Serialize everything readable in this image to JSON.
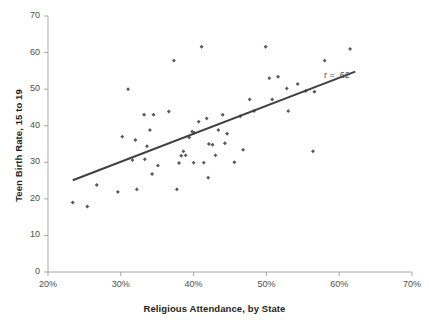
{
  "chart_data": {
    "type": "scatter",
    "title": "",
    "xlabel": "Religious Attendance, by State",
    "ylabel": "Teen Birth Rate, 15 to 19",
    "xlim": [
      20,
      70
    ],
    "ylim": [
      0,
      70
    ],
    "xticks": [
      20,
      30,
      40,
      50,
      60,
      70
    ],
    "yticks": [
      0,
      10,
      20,
      30,
      40,
      50,
      60,
      70
    ],
    "xtick_labels": [
      "20%",
      "30%",
      "40%",
      "50%",
      "60%",
      "70%"
    ],
    "ytick_labels": [
      "0",
      "10",
      "20",
      "30",
      "40",
      "50",
      "60",
      "70"
    ],
    "xtick_suffix": "%",
    "grid": false,
    "legend": "none",
    "marker_color": "#595959",
    "line_color": "#404040",
    "axis_color": "#a6a6a6",
    "annotations": [
      {
        "name": "correlation-label",
        "text": "r = .62",
        "x": 58.2,
        "y": 53.5
      }
    ],
    "trendline": {
      "name": "regression-line",
      "x_start": 23.4,
      "y_start": 25.1,
      "x_end": 62.2,
      "y_end": 54.8,
      "r": 0.62
    },
    "points": [
      {
        "x": 23.4,
        "y": 19.0
      },
      {
        "x": 25.4,
        "y": 17.9
      },
      {
        "x": 26.7,
        "y": 23.8
      },
      {
        "x": 29.6,
        "y": 21.9
      },
      {
        "x": 31.6,
        "y": 30.6
      },
      {
        "x": 32.2,
        "y": 22.6
      },
      {
        "x": 32.0,
        "y": 36.1
      },
      {
        "x": 30.2,
        "y": 37.0
      },
      {
        "x": 31.0,
        "y": 50.0
      },
      {
        "x": 33.3,
        "y": 30.8
      },
      {
        "x": 34.3,
        "y": 26.8
      },
      {
        "x": 33.2,
        "y": 43.0
      },
      {
        "x": 34.5,
        "y": 43.0
      },
      {
        "x": 34.0,
        "y": 38.8
      },
      {
        "x": 33.6,
        "y": 34.4
      },
      {
        "x": 35.1,
        "y": 29.1
      },
      {
        "x": 37.7,
        "y": 22.6
      },
      {
        "x": 36.6,
        "y": 43.9
      },
      {
        "x": 37.3,
        "y": 57.8
      },
      {
        "x": 38.0,
        "y": 29.8
      },
      {
        "x": 38.6,
        "y": 33.0
      },
      {
        "x": 38.3,
        "y": 31.8
      },
      {
        "x": 38.9,
        "y": 31.9
      },
      {
        "x": 39.4,
        "y": 36.8
      },
      {
        "x": 39.8,
        "y": 38.4
      },
      {
        "x": 40.1,
        "y": 38.1
      },
      {
        "x": 40.0,
        "y": 29.9
      },
      {
        "x": 41.4,
        "y": 29.9
      },
      {
        "x": 40.7,
        "y": 41.1
      },
      {
        "x": 41.1,
        "y": 61.6
      },
      {
        "x": 41.8,
        "y": 42.0
      },
      {
        "x": 42.1,
        "y": 35.0
      },
      {
        "x": 42.6,
        "y": 34.8
      },
      {
        "x": 42.0,
        "y": 25.8
      },
      {
        "x": 43.4,
        "y": 38.8
      },
      {
        "x": 43.0,
        "y": 31.9
      },
      {
        "x": 44.0,
        "y": 43.0
      },
      {
        "x": 44.3,
        "y": 35.2
      },
      {
        "x": 44.6,
        "y": 37.8
      },
      {
        "x": 45.6,
        "y": 30.0
      },
      {
        "x": 46.4,
        "y": 42.6
      },
      {
        "x": 46.8,
        "y": 33.4
      },
      {
        "x": 47.7,
        "y": 47.2
      },
      {
        "x": 48.3,
        "y": 44.0
      },
      {
        "x": 49.9,
        "y": 61.6
      },
      {
        "x": 50.4,
        "y": 53.0
      },
      {
        "x": 50.8,
        "y": 47.2
      },
      {
        "x": 51.6,
        "y": 53.4
      },
      {
        "x": 52.8,
        "y": 50.2
      },
      {
        "x": 53.0,
        "y": 44.0
      },
      {
        "x": 54.3,
        "y": 51.4
      },
      {
        "x": 55.4,
        "y": 49.5
      },
      {
        "x": 56.4,
        "y": 33.0
      },
      {
        "x": 56.6,
        "y": 49.3
      },
      {
        "x": 58.0,
        "y": 57.8
      },
      {
        "x": 61.5,
        "y": 61.0
      }
    ]
  }
}
